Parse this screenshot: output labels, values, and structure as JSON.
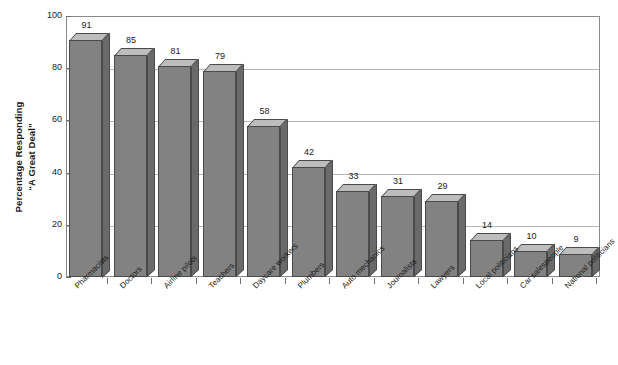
{
  "chart_data": {
    "type": "bar",
    "title": "",
    "subtitle": "",
    "xlabel": "",
    "ylabel": "Percentage Responding \"A Great Deal\"",
    "ylabel_lines": [
      "Percentage Responding",
      "“A Great Deal”"
    ],
    "ylim": [
      0,
      100
    ],
    "yticks": [
      0,
      20,
      40,
      60,
      80,
      100
    ],
    "ytick_labels": [
      "0",
      "20",
      "40",
      "60",
      "80",
      "100"
    ],
    "grid": "horizontal",
    "legend": "none",
    "orientation": "vertical",
    "style": "3d-bars",
    "categories": [
      "Pharmacists",
      "Doctors",
      "Airline pilots",
      "Teachers",
      "Daycare workers",
      "Plumbers",
      "Auto mechanics",
      "Journalists",
      "Lawyers",
      "Local politicians",
      "Car salespeople",
      "National politicians"
    ],
    "values": [
      91,
      85,
      81,
      79,
      58,
      42,
      33,
      31,
      29,
      14,
      10,
      9
    ],
    "value_labels": [
      "91",
      "85",
      "81",
      "79",
      "58",
      "42",
      "33",
      "31",
      "29",
      "14",
      "10",
      "9"
    ],
    "colors": {
      "bar_front": "#828282",
      "bar_top": "#bdbdbd",
      "bar_side": "#6a6a6a",
      "bar_outline": "#4a4a4a",
      "gridline": "#b6b6b6",
      "frame": "#8a8a8a",
      "text": "#1a1a1a",
      "background": "#ffffff"
    }
  }
}
